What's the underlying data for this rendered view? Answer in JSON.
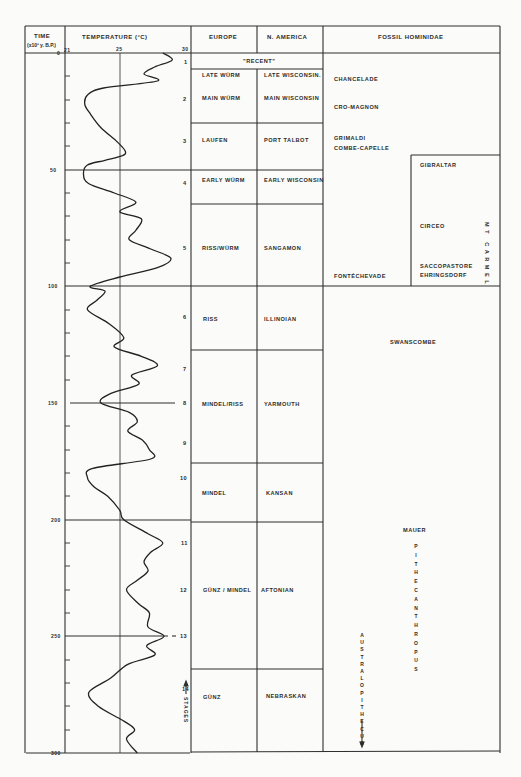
{
  "header": {
    "time_label": "TIME",
    "time_unit": "(x10³ y. B.P.)",
    "temperature_label": "TEMPERATURE (°C)",
    "europe_label": "EUROPE",
    "namerica_label": "N. AMERICA",
    "fossil_label": "FOSSIL  HOMINIDAE"
  },
  "axis": {
    "temp_ticks": [
      "21",
      "25",
      "30"
    ],
    "time_ticks": [
      "0",
      "50",
      "100",
      "150",
      "200",
      "250",
      "300"
    ]
  },
  "stages": [
    "1",
    "2",
    "3",
    "4",
    "5",
    "6",
    "7",
    "8",
    "9",
    "10",
    "11",
    "12",
    "13",
    "14"
  ],
  "stages_label": "STAGES",
  "recent_label": "\"RECENT\"",
  "rows": [
    {
      "europe": "LATE WÜRM",
      "namerica": "LATE WISCONSIN."
    },
    {
      "europe": "MAIN WÜRM",
      "namerica": "MAIN WISCONSIN"
    },
    {
      "europe": "LAUFEN",
      "namerica": "PORT TALBOT"
    },
    {
      "europe": "EARLY WÜRM",
      "namerica": "EARLY WISCONSIN"
    },
    {
      "europe": "RISS/WÜRM",
      "namerica": "SANGAMON"
    },
    {
      "europe": "RISS",
      "namerica": "ILLINOIAN"
    },
    {
      "europe": "MINDEL/RISS",
      "namerica": "YARMOUTH"
    },
    {
      "europe": "MINDEL",
      "namerica": "KANSAN"
    },
    {
      "europe": "GÜNZ / MINDEL",
      "namerica": "AFTONIAN"
    },
    {
      "europe": "GÜNZ",
      "namerica": "NEBRASKAN"
    }
  ],
  "fossils": {
    "chancelade": "CHANCELADE",
    "cromagnon": "CRO-MAGNON",
    "grimaldi": "GRIMALDI",
    "combe_capelle": "COMBE-CAPELLE",
    "fontechevade": "FONTÉCHEVADE",
    "gibraltar": "GIBRALTAR",
    "circeo": "CIRCEO",
    "saccopastore": "SACCOPASTORE",
    "ehringsdorf": "EHRINGSDORF",
    "mt_carmel": "MT CARMEL",
    "swanscombe": "SWANSCOMBE",
    "mauer": "MAUER",
    "pithecanthropus": "PITHECANTHROPUS",
    "australopithecus": "AUSTRALOPITHECUS"
  },
  "chart_data": {
    "type": "line",
    "xlabel": "TEMPERATURE (°C)",
    "ylabel": "TIME (x10³ y. B.P.)",
    "xlim": [
      21,
      30
    ],
    "ylim": [
      0,
      300
    ],
    "y_inverted": true,
    "grid": "major lines at 25°C and every 50 kyr",
    "series": [
      {
        "name": "Temperature",
        "time_kyr": [
          0,
          3,
          6,
          9,
          12,
          15,
          18,
          22,
          26,
          32,
          38,
          42,
          44,
          46,
          48,
          52,
          56,
          60,
          64,
          68,
          71,
          76,
          80,
          84,
          88,
          92,
          96,
          100,
          102,
          106,
          110,
          116,
          122,
          126,
          130,
          134,
          138,
          142,
          146,
          150,
          154,
          158,
          162,
          166,
          170,
          174,
          178,
          182,
          186,
          190,
          196,
          200,
          206,
          210,
          214,
          218,
          222,
          226,
          230,
          236,
          240,
          246,
          250,
          254,
          258,
          262,
          268,
          274,
          280,
          286,
          290,
          294,
          300
        ],
        "temperature_c": [
          28.2,
          28.9,
          27.6,
          26.8,
          27.8,
          23.8,
          22.6,
          22.4,
          22.8,
          23.6,
          24.8,
          25.4,
          25.2,
          23.9,
          22.6,
          22.3,
          22.7,
          24.6,
          26.2,
          25.0,
          26.6,
          26.2,
          25.7,
          27.3,
          28.8,
          27.8,
          25.0,
          22.8,
          23.9,
          23.3,
          22.6,
          24.2,
          25.3,
          24.6,
          26.6,
          27.8,
          25.9,
          26.4,
          24.3,
          23.6,
          25.7,
          26.3,
          25.6,
          26.7,
          27.2,
          27.3,
          23.0,
          22.6,
          23.1,
          24.1,
          25.0,
          25.3,
          27.1,
          28.2,
          27.3,
          26.8,
          27.1,
          26.3,
          25.5,
          26.4,
          27.2,
          27.1,
          28.3,
          27.0,
          27.6,
          25.6,
          24.3,
          22.7,
          23.4,
          25.2,
          26.1,
          25.5,
          26.3
        ]
      }
    ],
    "stages": [
      {
        "stage": 1,
        "time_kyr": 8
      },
      {
        "stage": 2,
        "time_kyr": 30
      },
      {
        "stage": 3,
        "time_kyr": 42
      },
      {
        "stage": 4,
        "time_kyr": 57
      },
      {
        "stage": 5,
        "time_kyr": 85
      },
      {
        "stage": 6,
        "time_kyr": 115
      },
      {
        "stage": 7,
        "time_kyr": 137
      },
      {
        "stage": 8,
        "time_kyr": 150
      },
      {
        "stage": 9,
        "time_kyr": 167
      },
      {
        "stage": 10,
        "time_kyr": 180
      },
      {
        "stage": 11,
        "time_kyr": 210
      },
      {
        "stage": 12,
        "time_kyr": 230
      },
      {
        "stage": 13,
        "time_kyr": 250
      },
      {
        "stage": 14,
        "time_kyr": 274
      }
    ]
  }
}
